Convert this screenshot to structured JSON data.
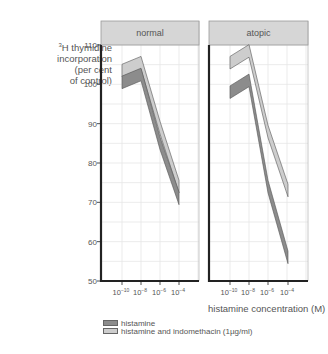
{
  "chart_data": {
    "type": "line",
    "title": "",
    "ylabel": "³H thymidine incorporation (per cent of control)",
    "ylabel_lines": [
      "H thymidine",
      "incorporation",
      "(per cent",
      "of control)"
    ],
    "ylabel_superscript": "3",
    "xlabel": "histamine concentration (M)",
    "ylim": [
      50,
      110
    ],
    "yticks": [
      50,
      60,
      70,
      80,
      90,
      100,
      110
    ],
    "x": [
      "10^-10",
      "10^-8",
      "10^-6",
      "10^-4"
    ],
    "x_tick_labels": [
      {
        "base": "10",
        "exp": "−10"
      },
      {
        "base": "10",
        "exp": "−8"
      },
      {
        "base": "10",
        "exp": "−6"
      },
      {
        "base": "10",
        "exp": "−4"
      }
    ],
    "grid": true,
    "legend_position": "bottom-left",
    "panels": [
      {
        "title": "normal",
        "series": [
          {
            "name": "histamine",
            "color": "#8c8c8c",
            "values": [
              100.5,
              102.5,
              85,
              71
            ]
          },
          {
            "name": "histamine and indomethacin (1µg/ml)",
            "color": "#cdcdcd",
            "values": [
              103.5,
              105.5,
              89,
              74
            ]
          }
        ]
      },
      {
        "title": "atopic",
        "series": [
          {
            "name": "histamine",
            "color": "#8c8c8c",
            "values": [
              98,
              101,
              74,
              56
            ]
          },
          {
            "name": "histamine and indomethacin (1µg/ml)",
            "color": "#cdcdcd",
            "values": [
              105.5,
              108.5,
              88,
              73
            ]
          }
        ]
      }
    ]
  },
  "legend": [
    {
      "label": "histamine",
      "color": "#8c8c8c"
    },
    {
      "label": "histamine and indomethacin (1µg/ml)",
      "color": "#cdcdcd"
    }
  ],
  "colors": {
    "header_bg": "#d6d6d6",
    "axis": "#222222",
    "grid": "#e6e6e6",
    "text": "#555555"
  }
}
